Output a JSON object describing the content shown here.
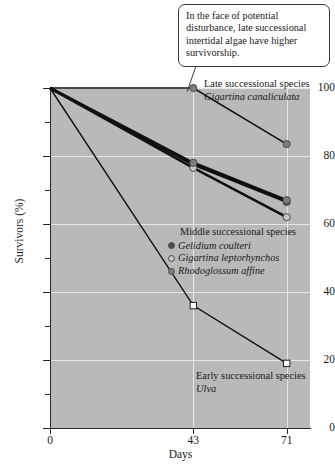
{
  "callout": {
    "text": "In the face of potential disturbance, late successional intertidal algae have higher survivorship."
  },
  "annotations": {
    "late": {
      "line1": "Late successional species",
      "line2": "Gigartina canaliculata"
    },
    "early": {
      "line1": "Early successional species",
      "line2": "Ulva"
    }
  },
  "legend": {
    "title": "Middle successional species",
    "items": [
      {
        "label": "Gelidium coulteri",
        "color": "#4a4a4a",
        "marker": "filled-circle"
      },
      {
        "label": "Gigartina leptorhynchos",
        "color": "#b0b0b0",
        "marker": "open-circle"
      },
      {
        "label": "Rhodoglossum affine",
        "color": "#7d7d7d",
        "marker": "gray-circle"
      }
    ]
  },
  "chart_data": {
    "type": "line",
    "title": "",
    "xlabel": "Days",
    "ylabel": "Survivors (%)",
    "x": [
      0,
      43,
      71
    ],
    "xlim": [
      0,
      78
    ],
    "ylim": [
      0,
      100
    ],
    "xticks": [
      0,
      43,
      71
    ],
    "xtick_labels": [
      "0",
      "43",
      "71"
    ],
    "yticks": [
      0,
      20,
      40,
      60,
      80,
      100
    ],
    "ytick_labels": [
      "0",
      "20",
      "40",
      "60",
      "80",
      "100"
    ],
    "yticks_minor": [
      10,
      30,
      50,
      70,
      90
    ],
    "grid": true,
    "legend_position": "inside-right",
    "series": [
      {
        "name": "Gigartina canaliculata",
        "group": "late successional",
        "values": [
          100,
          100,
          83.5
        ],
        "color": "#7d7d7d",
        "marker": "gray-circle",
        "line_width": 1.6
      },
      {
        "name": "Gelidium coulteri",
        "group": "middle successional",
        "values": [
          100,
          77.5,
          66.5
        ],
        "color": "#4a4a4a",
        "marker": "filled-circle",
        "line_width": 2.6
      },
      {
        "name": "Gigartina leptorhynchos",
        "group": "middle successional",
        "values": [
          100,
          76.5,
          62
        ],
        "color": "#b0b0b0",
        "marker": "open-circle",
        "line_width": 2.6
      },
      {
        "name": "Rhodoglossum affine",
        "group": "middle successional",
        "values": [
          100,
          78,
          67
        ],
        "color": "#7d7d7d",
        "marker": "gray-circle",
        "line_width": 2.6
      },
      {
        "name": "Ulva",
        "group": "early successional",
        "values": [
          100,
          36,
          19
        ],
        "color": "#ffffff",
        "marker": "open-square",
        "line_width": 1.4
      }
    ]
  }
}
